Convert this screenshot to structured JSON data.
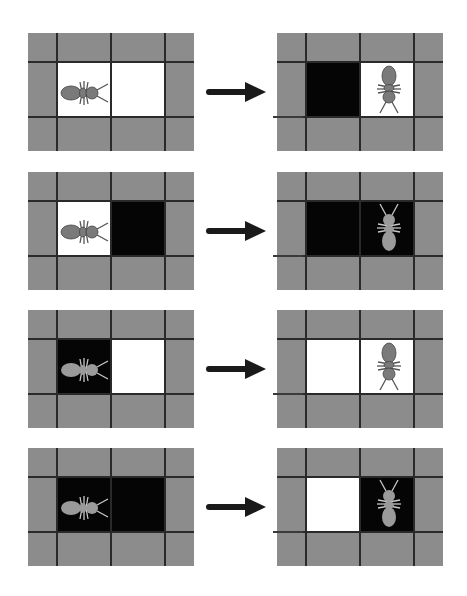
{
  "diagram": {
    "title": "",
    "colors": {
      "background": "#ffffff",
      "border_cell": "#8c8c8c",
      "grid_line": "#2a2a2a",
      "white_cell": "#ffffff",
      "black_cell": "#050505",
      "ant_on_white": "#7a7a7a",
      "ant_on_black": "#9a9a9a",
      "arrow": "#1a1a1a"
    },
    "rows": [
      {
        "before": {
          "left_cell": "white",
          "right_cell": "white",
          "ant_cell": "left",
          "ant_facing": "right"
        },
        "after": {
          "left_cell": "black",
          "right_cell": "white",
          "ant_cell": "right",
          "ant_facing": "down"
        }
      },
      {
        "before": {
          "left_cell": "white",
          "right_cell": "black",
          "ant_cell": "left",
          "ant_facing": "right"
        },
        "after": {
          "left_cell": "black",
          "right_cell": "black",
          "ant_cell": "right",
          "ant_facing": "up"
        }
      },
      {
        "before": {
          "left_cell": "black",
          "right_cell": "white",
          "ant_cell": "left",
          "ant_facing": "right"
        },
        "after": {
          "left_cell": "white",
          "right_cell": "white",
          "ant_cell": "right",
          "ant_facing": "down"
        }
      },
      {
        "before": {
          "left_cell": "black",
          "right_cell": "black",
          "ant_cell": "left",
          "ant_facing": "right"
        },
        "after": {
          "left_cell": "white",
          "right_cell": "black",
          "ant_cell": "right",
          "ant_facing": "up"
        }
      }
    ],
    "arrow_label": "transition-arrow"
  }
}
